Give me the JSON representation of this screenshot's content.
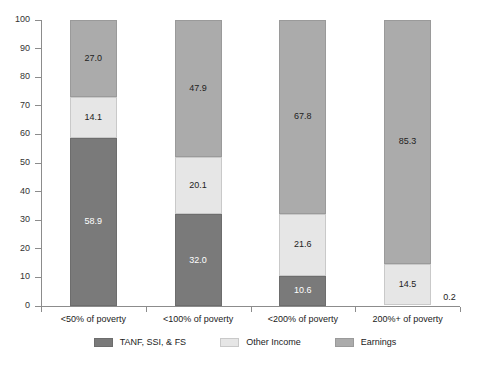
{
  "chart_data": {
    "type": "bar",
    "stacked": true,
    "title": "",
    "subtitle": "",
    "xlabel": "",
    "ylabel": "",
    "ylim": [
      0,
      100
    ],
    "yticks": [
      0,
      10,
      20,
      30,
      40,
      50,
      60,
      70,
      80,
      90,
      100
    ],
    "ytick_labels": [
      "0",
      "10",
      "20",
      "30",
      "40",
      "50",
      "60",
      "70",
      "80",
      "90",
      "100"
    ],
    "grid": false,
    "legend_position": "bottom",
    "categories": [
      "<50% of poverty",
      "<100% of poverty",
      "<200% of poverty",
      "200%+ of poverty"
    ],
    "series": [
      {
        "name": "TANF, SSI, & FS",
        "color": "#7a7a7a",
        "values": [
          58.9,
          32.0,
          10.6,
          0.2
        ],
        "labels": [
          "58.9",
          "32.0",
          "10.6",
          "0.2"
        ]
      },
      {
        "name": "Other Income",
        "color": "#e6e6e6",
        "values": [
          14.1,
          20.1,
          21.6,
          14.5
        ],
        "labels": [
          "14.1",
          "20.1",
          "21.6",
          "14.5"
        ]
      },
      {
        "name": "Earnings",
        "color": "#ababab",
        "values": [
          27.0,
          47.9,
          67.8,
          85.3
        ],
        "labels": [
          "27.0",
          "47.9",
          "67.8",
          "85.3"
        ]
      }
    ],
    "annotations": [
      {
        "text": "0.2",
        "category": "200%+ of poverty",
        "series": "TANF, SSI, & FS",
        "placement": "outside-right"
      }
    ]
  },
  "legend": {
    "items": [
      {
        "label": "TANF, SSI, & FS",
        "swatch": "dark"
      },
      {
        "label": "Other Income",
        "swatch": "light"
      },
      {
        "label": "Earnings",
        "swatch": "mid"
      }
    ]
  }
}
